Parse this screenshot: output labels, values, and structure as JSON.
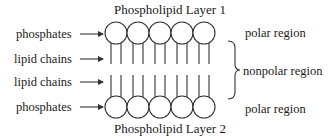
{
  "layers": {
    "top_title": "Phospholipid Layer 1",
    "bottom_title": "Phospholipid Layer 2"
  },
  "left_labels": [
    {
      "text": "phosphates"
    },
    {
      "text": "lipid chains"
    },
    {
      "text": "lipid chains"
    },
    {
      "text": "phosphates"
    }
  ],
  "right_labels": {
    "top": "polar region",
    "middle": "nonpolar region",
    "bottom": "polar region"
  },
  "molecules_per_layer": 5,
  "colors": {
    "stroke": "#333333",
    "text": "#1a1a1a",
    "background": "#ffffff"
  }
}
